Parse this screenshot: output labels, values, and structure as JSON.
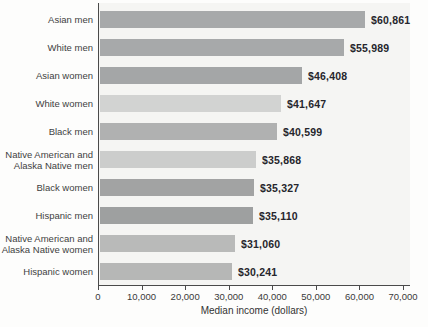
{
  "chart_data": {
    "type": "bar",
    "orientation": "horizontal",
    "title": "",
    "xlabel": "Median income (dollars)",
    "ylabel": "",
    "xlim": [
      0,
      70000
    ],
    "grid": false,
    "legend": false,
    "categories": [
      "Asian men",
      "White men",
      "Asian women",
      "White women",
      "Black men",
      "Native American and\nAlaska Native men",
      "Black women",
      "Hispanic men",
      "Native American and\nAlaska Native women",
      "Hispanic women"
    ],
    "values": [
      60861,
      55989,
      46408,
      41647,
      40599,
      35868,
      35327,
      35110,
      31060,
      30241
    ],
    "value_labels": [
      "$60,861",
      "$55,989",
      "$46,408",
      "$41,647",
      "$40,599",
      "$35,868",
      "$35,327",
      "$35,110",
      "$31,060",
      "$30,241"
    ],
    "bar_colors": [
      "#a7a9aa",
      "#a7a9aa",
      "#a4a6a7",
      "#d2d3d2",
      "#b0b1b1",
      "#cccdcc",
      "#a2a3a3",
      "#9ea0a0",
      "#b9bab9",
      "#b6b7b6"
    ],
    "x_ticks": [
      0,
      10000,
      20000,
      30000,
      40000,
      50000,
      60000,
      70000
    ],
    "x_tick_labels": [
      "0",
      "10,000",
      "20,000",
      "30,000",
      "40,000",
      "50,000",
      "60,000",
      "70,000"
    ]
  },
  "colors": {
    "axis": "#4a4a4a",
    "plot_background": "#f5f5f3",
    "page_background": "#fdfdfc",
    "category_text": "#3f3f3f",
    "value_text": "#26262c"
  }
}
